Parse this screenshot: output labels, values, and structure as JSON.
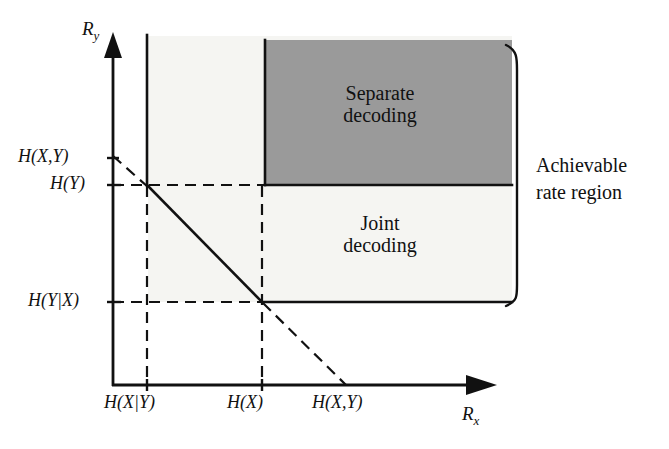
{
  "figure": {
    "type": "diagram",
    "background_color": "#ffffff",
    "line_color": "#111111",
    "shaded_region_color": "#9a9a9a",
    "faint_wash_color": "#f5f5f2"
  },
  "axes": {
    "y_axis_name": "R",
    "y_axis_subscript": "y",
    "x_axis_name": "R",
    "x_axis_subscript": "x",
    "origin_px": {
      "x": 113,
      "y": 385
    },
    "y_axis_top_px": 35,
    "x_axis_right_px": 495
  },
  "y_ticks": [
    {
      "label": "H(X,Y)",
      "y_px": 158
    },
    {
      "label": "H(Y)",
      "y_px": 185
    },
    {
      "label": "H(Y|X)",
      "y_px": 302
    }
  ],
  "x_ticks": [
    {
      "label": "H(X|Y)",
      "x_px": 147
    },
    {
      "label": "H(X)",
      "x_px": 262
    },
    {
      "label": "H(X,Y)",
      "x_px": 345
    }
  ],
  "regions": [
    {
      "name": "separate-decoding-region",
      "label_line_1": "Separate",
      "label_line_2": "decoding",
      "fill": "#9a9a9a",
      "rect_px": {
        "x": 265,
        "y": 40,
        "width": 247,
        "height": 145
      }
    },
    {
      "name": "joint-decoding-region",
      "label_line_1": "Joint",
      "label_line_2": "decoding",
      "fill": "#f5f5f2"
    }
  ],
  "annotations": {
    "bracket_label_line_1": "Achievable",
    "bracket_label_line_2": "rate region",
    "bracket_x_px": 517,
    "bracket_top_px": 45,
    "bracket_bottom_px": 305
  },
  "boundary": {
    "description": "Slepian-Wolf boundary: vertical at H(X|Y), diagonal of slope -1 from (H(X|Y),H(Y)) to (H(X),H(Y|X)), horizontal at H(Y|X); dashed extensions beyond.",
    "solid_segments": [
      {
        "from": [
          147,
          35
        ],
        "to": [
          147,
          185
        ]
      },
      {
        "from": [
          147,
          185
        ],
        "to": [
          262,
          302
        ]
      },
      {
        "from": [
          262,
          302
        ],
        "to": [
          512,
          302
        ]
      },
      {
        "from": [
          265,
          40
        ],
        "to": [
          265,
          185
        ]
      },
      {
        "from": [
          265,
          185
        ],
        "to": [
          512,
          185
        ]
      }
    ],
    "dashed_segments": [
      {
        "from": [
          113,
          158
        ],
        "to": [
          147,
          185
        ]
      },
      {
        "from": [
          262,
          302
        ],
        "to": [
          345,
          385
        ]
      },
      {
        "from": [
          113,
          185
        ],
        "to": [
          265,
          185
        ]
      },
      {
        "from": [
          113,
          302
        ],
        "to": [
          262,
          302
        ]
      },
      {
        "from": [
          147,
          185
        ],
        "to": [
          147,
          385
        ]
      },
      {
        "from": [
          262,
          185
        ],
        "to": [
          262,
          385
        ]
      }
    ]
  }
}
